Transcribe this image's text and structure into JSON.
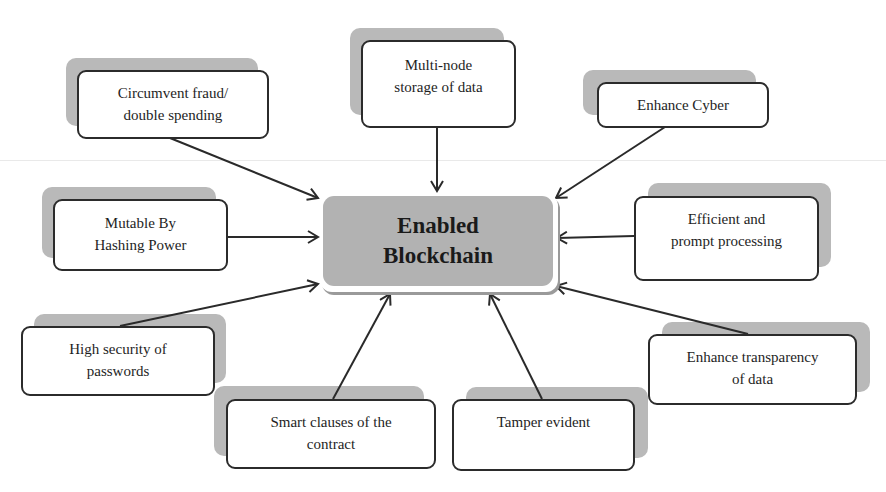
{
  "diagram": {
    "center": {
      "line1": "Enabled",
      "line2": "Blockchain",
      "fill": "#b2b2b2"
    },
    "nodes": [
      {
        "id": "circumvent",
        "line1": "Circumvent fraud/",
        "line2": "double spending"
      },
      {
        "id": "multinode",
        "line1": "Multi-node",
        "line2": "storage of data"
      },
      {
        "id": "cyber",
        "line1": "Enhance Cyber",
        "line2": ""
      },
      {
        "id": "mutable",
        "line1": "Mutable By",
        "line2": "Hashing Power"
      },
      {
        "id": "efficient",
        "line1": "Efficient and",
        "line2": "prompt processing"
      },
      {
        "id": "security",
        "line1": "High security of",
        "line2": "passwords"
      },
      {
        "id": "transparency",
        "line1": "Enhance transparency",
        "line2": "of data"
      },
      {
        "id": "smart",
        "line1": "Smart clauses of the",
        "line2": "contract"
      },
      {
        "id": "tamper",
        "line1": "Tamper evident",
        "line2": ""
      }
    ],
    "colors": {
      "box_border": "#2b2b2b",
      "shadow": "#b9b9b9",
      "arrow": "#2a2a2a"
    }
  }
}
